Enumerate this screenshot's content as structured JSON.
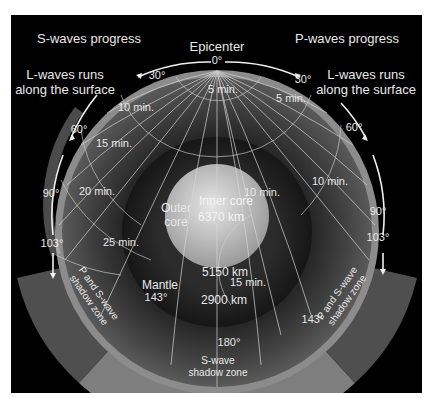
{
  "diagram": {
    "title_left": "S-waves progress",
    "title_right": "P-waves progress",
    "epicenter_label": "Epicenter",
    "l_waves_left": [
      "L-waves runs",
      "along the surface"
    ],
    "l_waves_right": [
      "L-waves runs",
      "along the surface"
    ],
    "angles_left": {
      "a0": "0°",
      "a30": "30°",
      "a60": "60°",
      "a90": "90°",
      "a103": "103°",
      "a143": "143°"
    },
    "angles_right": {
      "a30": "30°",
      "a60": "60°",
      "a90": "90°",
      "a103": "103°",
      "a143": "143°"
    },
    "angle_bottom": "180°",
    "times_left": [
      "5 min.",
      "10 min.",
      "15 min.",
      "20 min.",
      "25 min."
    ],
    "times_right": [
      "5 min.",
      "10 min.",
      "10 min.",
      "15 min."
    ],
    "layers": {
      "outer_core": [
        "Outer",
        "core"
      ],
      "inner_core": "Inner core",
      "inner_core_depth": "6370 km",
      "outer_core_depth": "5150 km",
      "mantle": "Mantle",
      "mantle_depth": "2900 km"
    },
    "shadow_zones": {
      "left": [
        "P and S-wave",
        "shadow zone"
      ],
      "right": [
        "P and S-wave",
        "shadow zone"
      ],
      "bottom": [
        "S-wave",
        "shadow zone"
      ]
    },
    "colors": {
      "background": "#000000",
      "crust": "#8a8a8a",
      "mantle": "#3a3a3a",
      "outer_core": "#2a2a2a",
      "inner_core": "#bdbdbd",
      "s_shadow": "#7d7d7d",
      "ps_shadow": "#4e4e4e",
      "text": "#e8e8e8"
    }
  }
}
